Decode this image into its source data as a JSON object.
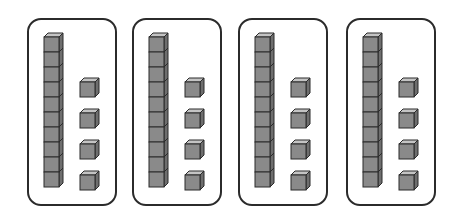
{
  "diagram": {
    "groups": [
      {
        "tens": 1,
        "ones": 4,
        "left": 27
      },
      {
        "tens": 1,
        "ones": 4,
        "left": 132
      },
      {
        "tens": 1,
        "ones": 4,
        "left": 238
      },
      {
        "tens": 1,
        "ones": 4,
        "left": 346
      }
    ],
    "rod_cubes": 10,
    "colors": {
      "front": "#8a8a8a",
      "top": "#c4c4c4",
      "side": "#6e6e6e",
      "outline": "#2b2b2b",
      "panel_border": "#2b2b2b"
    }
  }
}
